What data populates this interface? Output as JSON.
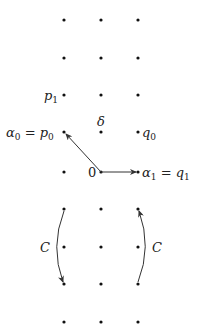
{
  "diagram": {
    "type": "lattice-grid",
    "columns_x": [
      64,
      101,
      138
    ],
    "rows_y": [
      20,
      58,
      95,
      132,
      172,
      209,
      247,
      284,
      322
    ],
    "dot_color": "#111111",
    "line_color": "#333333"
  },
  "labels": {
    "p1": "p",
    "p1_sub": "1",
    "alpha0": "α",
    "alpha0_sub": "0",
    "alpha0_eq": " = ",
    "p0": "p",
    "p0_sub": "0",
    "delta": "δ",
    "q0": "q",
    "q0_sub": "0",
    "zero": "0",
    "alpha1": "α",
    "alpha1_sub": "1",
    "alpha1_eq": " = ",
    "q1": "q",
    "q1_sub": "1",
    "c_left": "C",
    "c_right": "C"
  },
  "arrows": [
    {
      "name": "arrow-to-alpha0",
      "from": [
        101,
        172
      ],
      "to": [
        64,
        132
      ]
    },
    {
      "name": "arrow-to-alpha1",
      "from": [
        101,
        172
      ],
      "to": [
        136,
        172
      ]
    },
    {
      "name": "arc-left-C",
      "from": [
        64,
        209
      ],
      "to": [
        64,
        284
      ],
      "direction": "down"
    },
    {
      "name": "arc-right-C",
      "from": [
        138,
        284
      ],
      "to": [
        138,
        209
      ],
      "direction": "up"
    }
  ]
}
